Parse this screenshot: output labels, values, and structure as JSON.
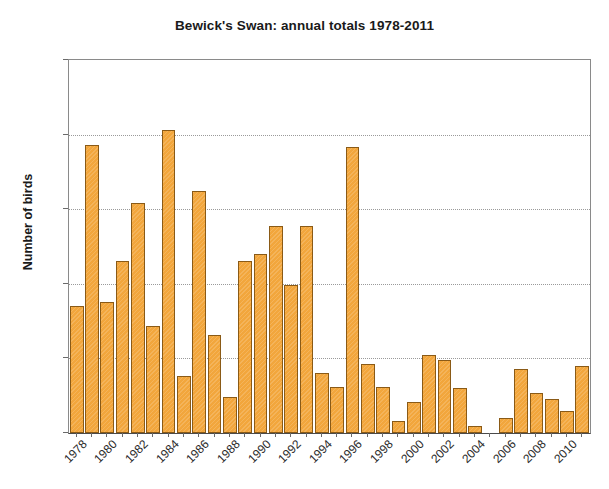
{
  "chart_data": {
    "type": "bar",
    "title": "Bewick's Swan: annual totals 1978-2011",
    "xlabel": "",
    "ylabel": "Number of birds",
    "ylim": [
      0,
      250
    ],
    "yticks": [
      0,
      50,
      100,
      150,
      200,
      250
    ],
    "grid": true,
    "legend": "none",
    "bar_color": "#f2a63c",
    "bar_border_color": "#8a5a16",
    "xtick_label_rotation": -45,
    "xtick_label_interval": 2,
    "categories": [
      "1978",
      "1979",
      "1980",
      "1981",
      "1982",
      "1983",
      "1984",
      "1985",
      "1986",
      "1987",
      "1988",
      "1989",
      "1990",
      "1991",
      "1992",
      "1993",
      "1994",
      "1995",
      "1996",
      "1997",
      "1998",
      "1999",
      "2000",
      "2001",
      "2002",
      "2003",
      "2004",
      "2005",
      "2006",
      "2007",
      "2008",
      "2009",
      "2010",
      "2011"
    ],
    "values": [
      85,
      193,
      88,
      115,
      154,
      72,
      203,
      38,
      162,
      66,
      24,
      115,
      120,
      139,
      99,
      139,
      40,
      31,
      192,
      46,
      31,
      8,
      21,
      52,
      49,
      30,
      5,
      0,
      10,
      43,
      27,
      23,
      15,
      45
    ],
    "visible_xtick_labels": [
      "1978",
      "1980",
      "1982",
      "1984",
      "1986",
      "1988",
      "1990",
      "1992",
      "1994",
      "1996",
      "1998",
      "2000",
      "2002",
      "2004",
      "2006",
      "2008",
      "2010"
    ]
  }
}
